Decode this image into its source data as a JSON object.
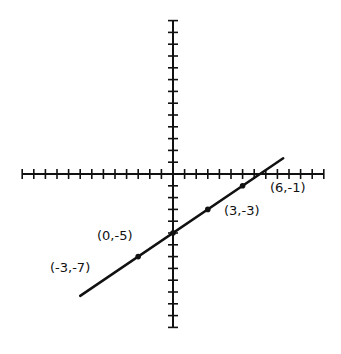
{
  "chart_data": {
    "type": "line",
    "title": "",
    "xlabel": "",
    "ylabel": "",
    "xlim": [
      -13,
      13
    ],
    "ylim": [
      -13,
      13
    ],
    "grid": false,
    "axes": {
      "tick_step": 1,
      "x_ticks_min": -13,
      "x_ticks_max": 13,
      "y_ticks_min": -13,
      "y_ticks_max": 13
    },
    "series": [
      {
        "name": "line",
        "equation": "y = (2/3)x - 5",
        "x": [
          -8,
          9.5
        ],
        "y": [
          -10.33,
          1.33
        ]
      }
    ],
    "points": [
      {
        "x": -3,
        "y": -7,
        "label": "(-3,-7)"
      },
      {
        "x": 0,
        "y": -5,
        "label": "(0,-5)"
      },
      {
        "x": 3,
        "y": -3,
        "label": "(3,-3)"
      },
      {
        "x": 6,
        "y": -1,
        "label": "(6,-1)"
      }
    ]
  },
  "labels": {
    "p1": "(-3,-7)",
    "p2": "(0,-5)",
    "p3": "(3,-3)",
    "p4": "(6,-1)"
  },
  "colors": {
    "axis": "#111111",
    "line": "#111111",
    "background": "#ffffff"
  }
}
